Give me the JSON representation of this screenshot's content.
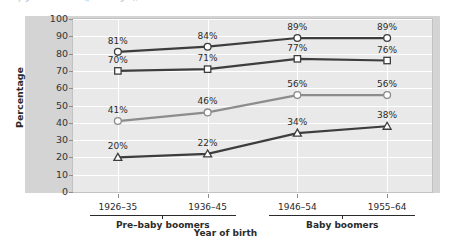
{
  "caption": {
    "text": "...by generation ...... (percentages), ......"
  },
  "chart_data": {
    "type": "line",
    "title": "",
    "xlabel": "Year of birth",
    "ylabel": "Percentage",
    "ylim": [
      0,
      100
    ],
    "ytick_step": 10,
    "grid": true,
    "legend": "none",
    "categories": [
      "1926–35",
      "1936–45",
      "1946–54",
      "1955–64"
    ],
    "category_groups": [
      {
        "label": "Pre–baby boomers",
        "categories": [
          "1926–35",
          "1936–45"
        ]
      },
      {
        "label": "Baby boomers",
        "categories": [
          "1946–54",
          "1955–64"
        ]
      }
    ],
    "yticks": [
      0,
      10,
      20,
      30,
      40,
      50,
      60,
      70,
      80,
      90,
      100
    ],
    "series": [
      {
        "name": "series-1",
        "marker": "circle",
        "color": "#3d3d3d",
        "values": [
          81,
          84,
          89,
          89
        ],
        "labels": [
          "81%",
          "84%",
          "89%",
          "89%"
        ]
      },
      {
        "name": "series-2",
        "marker": "square",
        "color": "#3d3d3d",
        "values": [
          70,
          71,
          77,
          76
        ],
        "labels": [
          "70%",
          "71%",
          "77%",
          "76%"
        ]
      },
      {
        "name": "series-3",
        "marker": "circle",
        "color": "#8c8c8c",
        "values": [
          41,
          46,
          56,
          56
        ],
        "labels": [
          "41%",
          "46%",
          "56%",
          "56%"
        ]
      },
      {
        "name": "series-4",
        "marker": "triangle",
        "color": "#3d3d3d",
        "values": [
          20,
          22,
          34,
          38
        ],
        "labels": [
          "20%",
          "22%",
          "34%",
          "38%"
        ]
      }
    ],
    "colors": {
      "panel_background": "#d4d4d4",
      "plot_background": "#e9e9e9",
      "gridline": "#ffffff",
      "axis": "#8d8d8d",
      "text": "#2b2b2b"
    }
  }
}
